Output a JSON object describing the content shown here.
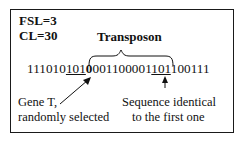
{
  "parameters": [
    {
      "label": "FSL=3"
    },
    {
      "label": "CL=30"
    }
  ],
  "transposon_label": "Transposon",
  "sequence": {
    "prefix": "111010",
    "gene_t": "101",
    "transposon_first_bold": "0",
    "middle": "001100001",
    "identical": "101",
    "suffix": "100111"
  },
  "annotations": {
    "gene_t_line1": "Gene T,",
    "gene_t_line2": "randomly selected",
    "identical_line1": "Sequence identical",
    "identical_line2": "to the first one"
  },
  "colors": {
    "ink": "#111111",
    "background": "#ffffff"
  }
}
